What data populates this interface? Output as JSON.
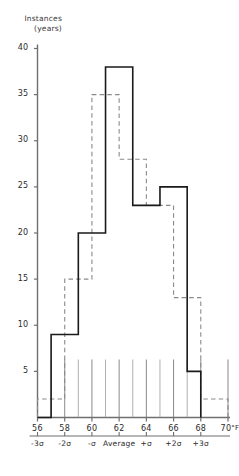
{
  "chart_data": {
    "type": "bar",
    "title": "",
    "subtitle": "",
    "ylabel_line1": "Instances",
    "ylabel_line2": "(years)",
    "xlabel": "",
    "ylim": [
      0,
      40
    ],
    "xlim": [
      56,
      70
    ],
    "grid": false,
    "legend": "none",
    "y_ticks": [
      5,
      10,
      15,
      20,
      25,
      30,
      35,
      40
    ],
    "y_tick_labels": [
      "5",
      "10",
      "15",
      "20",
      "25",
      "30",
      "35",
      "40"
    ],
    "x_ticks": [
      56,
      58,
      60,
      62,
      64,
      66,
      68,
      70
    ],
    "x_tick_labels": [
      "56",
      "58",
      "60",
      "62",
      "64",
      "66",
      "68",
      "70"
    ],
    "x_unit_suffix": "°F",
    "sigma_ticks": [
      56,
      58,
      60,
      62,
      64,
      66,
      68
    ],
    "sigma_tick_labels": [
      "-3σ",
      "-2σ",
      "-σ",
      "Average",
      "+σ",
      "+2σ",
      "+3σ"
    ],
    "series": [
      {
        "name": "solid-histogram",
        "style": "solid",
        "color": "#1a1a1a",
        "bin_edges": [
          56,
          57,
          59,
          61,
          63,
          65,
          67,
          68
        ],
        "bin_labels": [
          "56-57",
          "57-59",
          "59-61",
          "61-63",
          "63-65",
          "65-67",
          "67-68"
        ],
        "values": [
          0,
          9,
          20,
          38,
          23,
          25,
          5
        ]
      },
      {
        "name": "dashed-histogram",
        "style": "dashed",
        "color": "#8a8a8a",
        "bin_edges": [
          56,
          58,
          60,
          62,
          64,
          66,
          68,
          70
        ],
        "bin_labels": [
          "56-58",
          "58-60",
          "60-62",
          "62-64",
          "64-66",
          "66-68",
          "68-70"
        ],
        "values": [
          2,
          15,
          35,
          28,
          23,
          13,
          2
        ]
      }
    ]
  },
  "axis": {
    "y_title_1": "Instances",
    "y_title_2": "(years)",
    "degree_suffix": "°F"
  }
}
